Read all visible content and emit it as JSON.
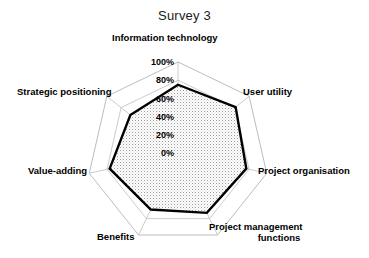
{
  "chart_data": {
    "type": "radar",
    "title": "Survey 3",
    "xlabel": "",
    "ylabel": "",
    "grid": true,
    "legend": "none",
    "ylim": [
      0,
      100
    ],
    "tick_labels": [
      "0%",
      "20%",
      "40%",
      "60%",
      "80%",
      "100%"
    ],
    "tick_values": [
      0,
      20,
      40,
      60,
      80,
      100
    ],
    "categories": [
      "Information technology",
      "User utility",
      "Project organisation",
      "Project management functions",
      "Benefits",
      "Value-adding",
      "Strategic positioning"
    ],
    "values": [
      75,
      81,
      77,
      73,
      69,
      77,
      67
    ],
    "series": [
      {
        "name": "Survey 3",
        "values": [
          75,
          81,
          77,
          73,
          69,
          77,
          67
        ]
      }
    ],
    "colors": {
      "data_line": "#000000",
      "data_fill": "#e8e8e8",
      "grid_line": "#b4b4b4",
      "text": "#000000",
      "background": "#ffffff"
    }
  },
  "labels": {
    "information_technology": "Information technology",
    "user_utility": "User utility",
    "project_organisation": "Project organisation",
    "project_management_functions_line1": "Project management",
    "project_management_functions_line2": "functions",
    "benefits": "Benefits",
    "value_adding": "Value-adding",
    "strategic_positioning": "Strategic positioning"
  },
  "ticks": {
    "t0": "0%",
    "t20": "20%",
    "t40": "40%",
    "t60": "60%",
    "t80": "80%",
    "t100": "100%"
  }
}
